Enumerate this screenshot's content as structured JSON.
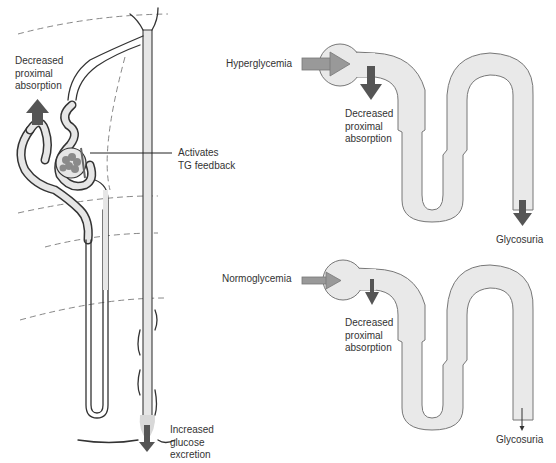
{
  "left_panel": {
    "labels": {
      "decreased_proximal": "Decreased\nproximal\nabsorption",
      "activates_tg": "Activates\nTG feedback",
      "increased_excretion": "Increased\nglucose\nexcretion"
    }
  },
  "top_right_panel": {
    "input_label": "Hyperglycemia",
    "proximal_label": "Decreased\nproximal\nabsorption",
    "output_label": "Glycosuria",
    "output_arrow": "large"
  },
  "bottom_right_panel": {
    "input_label": "Normoglycemia",
    "proximal_label": "Decreased\nproximal\nabsorption",
    "output_label": "Glycosuria",
    "output_arrow": "thin"
  },
  "colors": {
    "tube_fill": "#e6e6e6",
    "arrow_dark": "#555555",
    "arrow_light": "#999999",
    "dash": "#888888"
  }
}
